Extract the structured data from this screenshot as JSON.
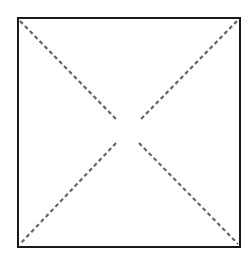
{
  "diagram": {
    "colors": {
      "background": "#ffffff",
      "square_stroke": "#1a1a1a",
      "diagonal_stroke": "#666666"
    },
    "square": {
      "x": 18,
      "y": 18,
      "width": 222,
      "height": 229,
      "stroke_width": 2
    },
    "diagonals": [
      {
        "name": "top-left-to-center",
        "x1": 20,
        "y1": 21,
        "x2": 116,
        "y2": 119
      },
      {
        "name": "center-to-bottom-right",
        "x1": 139,
        "y1": 143,
        "x2": 238,
        "y2": 244
      },
      {
        "name": "top-right-to-center",
        "x1": 237,
        "y1": 21,
        "x2": 141,
        "y2": 119
      },
      {
        "name": "center-to-bottom-left",
        "x1": 116,
        "y1": 143,
        "x2": 20,
        "y2": 244
      }
    ],
    "dash_pattern": "4 3",
    "diagonal_stroke_width": 2.2
  }
}
